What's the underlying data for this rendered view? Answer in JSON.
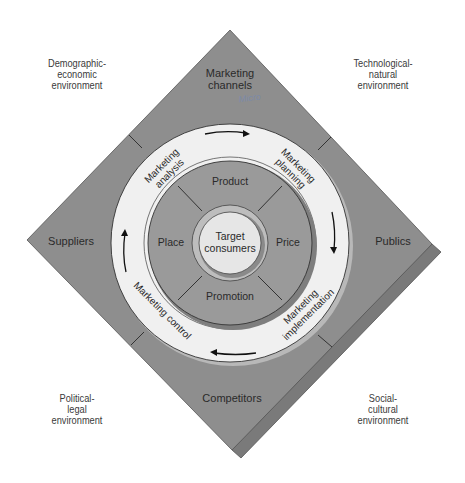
{
  "environments": {
    "top_left": [
      "Demographic-",
      "economic",
      "environment"
    ],
    "top_right": [
      "Technological-",
      "natural",
      "environment"
    ],
    "bottom_left": [
      "Political-",
      "legal",
      "environment"
    ],
    "bottom_right": [
      "Social-",
      "cultural",
      "environment"
    ]
  },
  "actors": {
    "top": [
      "Marketing",
      "channels"
    ],
    "left": "Suppliers",
    "right": "Publics",
    "bottom": "Competitors"
  },
  "annotation": "Micro",
  "process": {
    "analysis": [
      "Marketing",
      "analysis"
    ],
    "planning": [
      "Marketing",
      "planning"
    ],
    "implementation": [
      "Marketing",
      "implementation"
    ],
    "control": "Marketing control"
  },
  "marketing_mix": {
    "top": "Product",
    "left": "Place",
    "right": "Price",
    "bottom": "Promotion"
  },
  "center": [
    "Target",
    "consumers"
  ],
  "colors": {
    "diamond": "#8e8e8e",
    "diamond_shadow": "#7a7a7a",
    "ring": "#f0f0f0",
    "mix": "#9a9a9a",
    "center": "#e6e6e6",
    "annotation": "#7c8aa8"
  }
}
